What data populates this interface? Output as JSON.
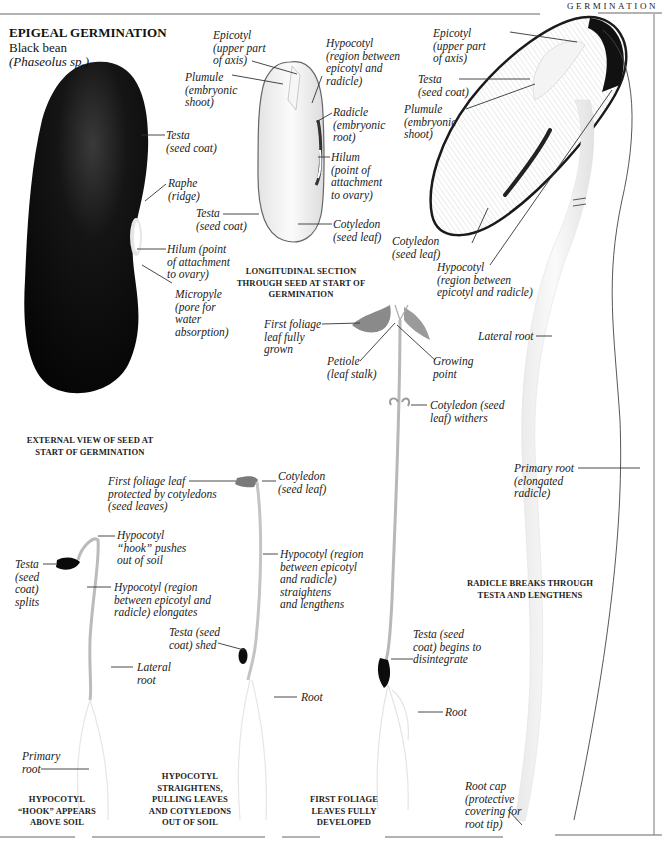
{
  "header": {
    "section": "GERMINATION"
  },
  "title": {
    "heading": "EPIGEAL GERMINATION",
    "common_name": "Black bean",
    "scientific_name": "(Phaseolus sp.)"
  },
  "colors": {
    "ink": "#222222",
    "seed_black": "#0d0d0d",
    "rule": "#555555"
  },
  "panels": {
    "external_view": {
      "caption": "EXTERNAL VIEW OF SEED AT\nSTART OF GERMINATION",
      "labels": [
        {
          "id": "testa",
          "text": "Testa\n(seed coat)"
        },
        {
          "id": "raphe",
          "text": "Raphe\n(ridge)"
        },
        {
          "id": "hilum",
          "text": "Hilum (point\nof attachment\nto ovary)"
        },
        {
          "id": "micropyle",
          "text": "Micropyle\n(pore for\nwater\nabsorption)"
        }
      ]
    },
    "longitudinal_section": {
      "caption": "LONGITUDINAL SECTION\nTHROUGH SEED AT START OF\nGERMINATION",
      "labels": [
        {
          "id": "epicotyl",
          "text": "Epicotyl\n(upper part\nof axis)"
        },
        {
          "id": "plumule",
          "text": "Plumule\n(embryonic\nshoot)"
        },
        {
          "id": "hypocotyl",
          "text": "Hypocotyl\n(region between\nepicotyl and\nradicle)"
        },
        {
          "id": "radicle",
          "text": "Radicle\n(embryonic\nroot)"
        },
        {
          "id": "hilum",
          "text": "Hilum\n(point of\nattachment\nto ovary)"
        },
        {
          "id": "testa",
          "text": "Testa\n(seed coat)"
        },
        {
          "id": "cotyledon",
          "text": "Cotyledon\n(seed leaf)"
        }
      ]
    },
    "radicle_breaks": {
      "caption": "RADICLE BREAKS THROUGH\nTESTA AND LENGTHENS",
      "labels": [
        {
          "id": "epicotyl",
          "text": "Epicotyl\n(upper part\nof axis)"
        },
        {
          "id": "testa",
          "text": "Testa\n(seed coat)"
        },
        {
          "id": "plumule",
          "text": "Plumule\n(embryonic\nshoot)"
        },
        {
          "id": "cotyledon",
          "text": "Cotyledon\n(seed leaf)"
        },
        {
          "id": "hypocotyl",
          "text": "Hypocotyl\n(region between\nepicotyl and radicle)"
        },
        {
          "id": "lateral_root",
          "text": "Lateral root"
        },
        {
          "id": "primary_root",
          "text": "Primary root\n(elongated\nradicle)"
        },
        {
          "id": "root_cap",
          "text": "Root cap\n(protective\ncovering for\nroot tip)"
        }
      ]
    },
    "hook_stage": {
      "caption": "HYPOCOTYL\n“HOOK” APPEARS\nABOVE SOIL",
      "labels": [
        {
          "id": "testa_splits",
          "text": "Testa\n(seed\ncoat)\nsplits"
        },
        {
          "id": "hook",
          "text": "Hypocotyl\n“hook” pushes\nout of soil"
        },
        {
          "id": "hypocotyl",
          "text": "Hypocotyl (region\nbetween epicotyl and\nradicle) elongates"
        },
        {
          "id": "lateral_root",
          "text": "Lateral\nroot"
        },
        {
          "id": "primary_root",
          "text": "Primary\nroot"
        }
      ]
    },
    "straightens_stage": {
      "caption": "HYPOCOTYL\nSTRAIGHTENS,\nPULLING LEAVES\nAND COTYLEDONS\nOUT OF SOIL",
      "labels": [
        {
          "id": "foliage",
          "text": "First foliage leaf\nprotected by cotyledons\n(seed leaves)"
        },
        {
          "id": "cotyledon",
          "text": "Cotyledon\n(seed leaf)"
        },
        {
          "id": "hypocotyl",
          "text": "Hypocotyl (region\nbetween epicotyl\nand radicle)\nstraightens\nand lengthens"
        },
        {
          "id": "testa_shed",
          "text": "Testa (seed\ncoat) shed"
        },
        {
          "id": "root",
          "text": "Root"
        }
      ]
    },
    "foliage_stage": {
      "caption": "FIRST FOLIAGE\nLEAVES FULLY\nDEVELOPED",
      "labels": [
        {
          "id": "first_foliage",
          "text": "First foliage\nleaf fully\ngrown"
        },
        {
          "id": "petiole",
          "text": "Petiole\n(leaf stalk)"
        },
        {
          "id": "growing_point",
          "text": "Growing\npoint"
        },
        {
          "id": "cotyledon_withers",
          "text": "Cotyledon (seed\nleaf) withers"
        },
        {
          "id": "testa_disintegrate",
          "text": "Testa (seed\ncoat) begins to\ndisintegrate"
        },
        {
          "id": "root",
          "text": "Root"
        }
      ]
    }
  }
}
